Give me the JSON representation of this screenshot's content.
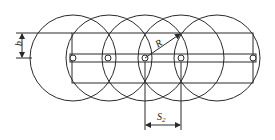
{
  "diagram": {
    "type": "overlapping-circles-coverage",
    "stroke_color": "#2a2a2a",
    "circles": {
      "count": 5,
      "radius": 43,
      "center_y": 58,
      "centers_x": [
        73,
        109,
        145,
        181,
        217
      ]
    },
    "strip": {
      "x": 72,
      "y": 33,
      "width": 181,
      "height": 50
    },
    "bar": {
      "y": 54,
      "height": 8
    },
    "holes_x": [
      73,
      108,
      145,
      181,
      253
    ],
    "labels": {
      "b": "b",
      "R": "R",
      "S2_main": "S",
      "S2_sub": "2"
    }
  }
}
